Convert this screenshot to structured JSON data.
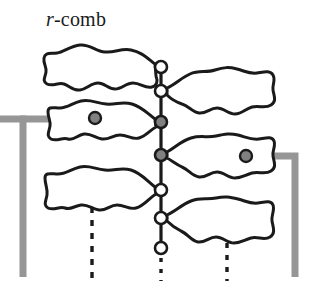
{
  "figure": {
    "caption_prefix": "r",
    "caption_suffix": "-comb",
    "caption_full": "r-comb",
    "width": 319,
    "height": 298,
    "background_color": "#ffffff"
  },
  "colors": {
    "outline": "#1a1a1a",
    "spine": "#1a1a1a",
    "node_fill_white": "#ffffff",
    "node_fill_gray": "#808080",
    "highlight_path": "#969696",
    "dashed": "#1a1a1a"
  },
  "spine": {
    "x": 161,
    "y_top": 67,
    "y_bottom": 248,
    "stroke_width": 3,
    "nodes": [
      {
        "id": "node-1",
        "cx": 161,
        "cy": 67,
        "r": 6,
        "fill": "white"
      },
      {
        "id": "node-2",
        "cx": 161,
        "cy": 91,
        "r": 6,
        "fill": "white"
      },
      {
        "id": "node-3",
        "cx": 161,
        "cy": 122,
        "r": 6,
        "fill": "gray"
      },
      {
        "id": "node-4",
        "cx": 161,
        "cy": 155,
        "r": 6,
        "fill": "gray"
      },
      {
        "id": "node-5",
        "cx": 161,
        "cy": 190,
        "r": 6,
        "fill": "white"
      },
      {
        "id": "node-6",
        "cx": 161,
        "cy": 218,
        "r": 6,
        "fill": "white"
      },
      {
        "id": "node-7",
        "cx": 161,
        "cy": 248,
        "r": 6,
        "fill": "white"
      }
    ]
  },
  "blobs": [
    {
      "id": "blob-top-left",
      "side": "left",
      "attach_node": "node-1",
      "has_inner_node": false
    },
    {
      "id": "blob-upper-right",
      "side": "right",
      "attach_node": "node-2",
      "has_inner_node": false
    },
    {
      "id": "blob-mid-left",
      "side": "left",
      "attach_node": "node-3",
      "has_inner_node": true,
      "inner_node": {
        "cx": 95,
        "cy": 117,
        "r": 6,
        "fill": "gray"
      }
    },
    {
      "id": "blob-mid-right",
      "side": "right",
      "attach_node": "node-4",
      "has_inner_node": true,
      "inner_node": {
        "cx": 246,
        "cy": 156,
        "r": 6,
        "fill": "gray"
      }
    },
    {
      "id": "blob-lower-left",
      "side": "left",
      "attach_node": "node-5",
      "has_inner_node": false
    },
    {
      "id": "blob-lower-right",
      "side": "right",
      "attach_node": "node-6",
      "has_inner_node": false
    }
  ],
  "highlight_path": {
    "stroke_width": 6,
    "color": "#969696",
    "left_branch": "enters from left edge, runs right at y=120 to x=23 corner, down to y=275; horizontal segment passes into blob-mid-left, thin trace through blob to node-3",
    "right_branch": "exits node-4 through blob-mid-right, right to x=295, down to y=275"
  },
  "dashed_lines": [
    {
      "id": "dashed-left",
      "x": 92,
      "y_start": 207,
      "y_end": 281
    },
    {
      "id": "dashed-center",
      "x": 161,
      "y_start": 258,
      "y_end": 281
    },
    {
      "id": "dashed-right",
      "x": 227,
      "y_start": 243,
      "y_end": 281
    }
  ]
}
